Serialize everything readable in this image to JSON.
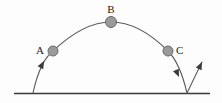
{
  "figure": {
    "background_color": "#fdfdfd",
    "stroke_color": "#5a5a5a",
    "ground_color": "#3a3a3a",
    "ball_fill": "#9a9a9a",
    "ball_stroke": "#6b6b6b",
    "label_color": "#1c1c1c"
  },
  "ground": {
    "name": "ground-line",
    "x1": 14,
    "y1": 93.5,
    "x2": 210,
    "y2": 93.5
  },
  "trajectory": {
    "name": "projectile-arc",
    "launch_x": 33,
    "launch_y": 93,
    "apex_x": 111,
    "apex_y": 22,
    "landing_x": 187,
    "landing_y": 93,
    "path": "M 33 93 C 38 70, 44 58, 53 51 C 72 33, 92 22, 111 22 C 130 22, 150 33, 168 51 C 177 60, 183 76, 187 93"
  },
  "bounce": {
    "name": "rebound-path",
    "path": "M 187 93 L 202 62",
    "start_x": 187,
    "start_y": 93,
    "end_x": 202,
    "end_y": 62
  },
  "points": [
    {
      "id": "A",
      "label": "A",
      "name": "ball-a",
      "cx": 53,
      "cy": 51,
      "r": 5,
      "label_x": 44,
      "label_y": 54,
      "label_anchor": "end"
    },
    {
      "id": "B",
      "label": "B",
      "name": "ball-b",
      "cx": 111,
      "cy": 22,
      "r": 5.5,
      "label_x": 111,
      "label_y": 13,
      "label_anchor": "middle"
    },
    {
      "id": "C",
      "label": "C",
      "name": "ball-c",
      "cx": 168,
      "cy": 51,
      "r": 5,
      "label_x": 176,
      "label_y": 54,
      "label_anchor": "start"
    }
  ],
  "arrows": [
    {
      "name": "launch-arrow",
      "tip_x": 44,
      "tip_y": 61,
      "angle_deg": -62,
      "description": "upward arrowhead on ascending branch"
    },
    {
      "name": "landing-arrow",
      "tip_x": 179,
      "tip_y": 76,
      "angle_deg": 68,
      "description": "downward arrowhead on descending branch"
    },
    {
      "name": "rebound-arrow",
      "tip_x": 202,
      "tip_y": 62,
      "angle_deg": -64,
      "description": "upward arrowhead on rebound branch"
    }
  ]
}
